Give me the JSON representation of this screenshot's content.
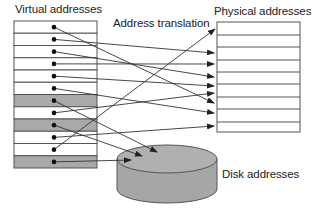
{
  "labels": {
    "virtual": "Virtual addresses",
    "translation": "Address translation",
    "physical": "Physical addresses",
    "disk": "Disk addresses"
  },
  "colors": {
    "line": "#333333",
    "shade": "#a9a9a9",
    "disk_fill": "#a6a6a6",
    "border": "#555555"
  },
  "virtual_table": {
    "x": 14,
    "y": 21,
    "width": 83,
    "row_height": 12.25,
    "rows": [
      {
        "index": 0,
        "shaded": false,
        "maps_to": "physical",
        "target_y": 103
      },
      {
        "index": 1,
        "shaded": false,
        "maps_to": "physical",
        "target_y": 53
      },
      {
        "index": 2,
        "shaded": false,
        "maps_to": "physical",
        "target_y": 77
      },
      {
        "index": 3,
        "shaded": false,
        "maps_to": "physical",
        "target_y": 64
      },
      {
        "index": 4,
        "shaded": false,
        "maps_to": "physical",
        "target_y": 86
      },
      {
        "index": 5,
        "shaded": false,
        "maps_to": "physical",
        "target_y": 113
      },
      {
        "index": 6,
        "shaded": true,
        "maps_to": "disk",
        "target": [
          157,
          152
        ]
      },
      {
        "index": 7,
        "shaded": false,
        "maps_to": "physical",
        "target_y": 93
      },
      {
        "index": 8,
        "shaded": true,
        "maps_to": "disk",
        "target": [
          142,
          156
        ]
      },
      {
        "index": 9,
        "shaded": false,
        "maps_to": "physical",
        "target_y": 126
      },
      {
        "index": 10,
        "shaded": false,
        "maps_to": "physical",
        "target": [
          215,
          29
        ]
      },
      {
        "index": 11,
        "shaded": true,
        "maps_to": "disk",
        "target": [
          131,
          160
        ]
      }
    ]
  },
  "physical_table": {
    "x": 217,
    "y": 22,
    "width": 83,
    "row_lines": [
      35,
      47,
      60,
      72,
      84,
      97,
      109,
      122
    ],
    "bottom": 132
  },
  "disk": {
    "cx": 167,
    "cy_top": 159,
    "cy_bottom": 189,
    "rx": 50,
    "ry": 14
  }
}
